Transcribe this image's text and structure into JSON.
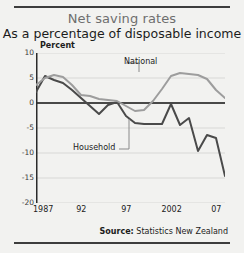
{
  "title": "Net saving rates",
  "subtitle": "As a percentage of disposable income",
  "axis_unit": "Percent",
  "source_label": "Source:",
  "source_value": "Statistics New Zealand",
  "colors": {
    "household": "#4a4a4a",
    "national": "#9d9d9d",
    "zero_line": "#111111",
    "grid": "#d8d8d6",
    "background": "#f2f2f0",
    "title": "#6e6e6e",
    "text": "#1c1c1c"
  },
  "chart_data": {
    "type": "line",
    "title": "Net saving rates",
    "subtitle": "As a percentage of disposable income",
    "xlabel": "",
    "ylabel": "Percent",
    "xlim": [
      1987,
      2008
    ],
    "ylim": [
      -20,
      10
    ],
    "yticks": [
      10,
      5,
      0,
      -5,
      -10,
      -15,
      -20
    ],
    "ytick_labels": [
      "10",
      "5",
      "0",
      "-5",
      "-10",
      "-15",
      "-20"
    ],
    "xticks": [
      1987,
      1992,
      1997,
      2002,
      2007
    ],
    "xtick_labels": [
      "1987",
      "92",
      "97",
      "2002",
      "07"
    ],
    "grid": "horizontal",
    "legend": "inline-labels",
    "zero_line": true,
    "x": [
      1987,
      1988,
      1989,
      1990,
      1991,
      1992,
      1993,
      1994,
      1995,
      1996,
      1997,
      1998,
      1999,
      2000,
      2001,
      2002,
      2003,
      2004,
      2005,
      2006,
      2007,
      2008
    ],
    "series": [
      {
        "name": "Household",
        "color": "#4a4a4a",
        "values": [
          2.2,
          5.4,
          4.6,
          4.0,
          2.6,
          1.0,
          -0.6,
          -2.2,
          -0.4,
          0.2,
          -2.6,
          -4.0,
          -4.2,
          -4.2,
          -4.2,
          -0.2,
          -4.4,
          -3.0,
          -9.6,
          -6.4,
          -7.0,
          -14.6
        ]
      },
      {
        "name": "National",
        "color": "#9d9d9d",
        "values": [
          3.6,
          5.0,
          5.6,
          5.2,
          3.6,
          1.6,
          1.4,
          0.8,
          0.6,
          0.4,
          -0.6,
          -1.6,
          -1.4,
          0.4,
          2.8,
          5.4,
          6.0,
          5.8,
          5.6,
          4.8,
          2.6,
          1.0
        ]
      }
    ],
    "annotations": [
      {
        "text": "National",
        "x": 2001,
        "y": 8.0
      },
      {
        "text": "Household",
        "x": 1996,
        "y": -9.2
      }
    ]
  }
}
